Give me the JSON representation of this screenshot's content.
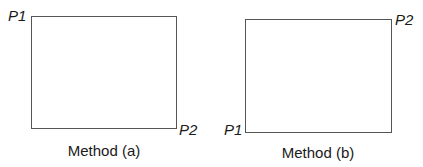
{
  "panels": [
    {
      "caption": "Method (a)",
      "rect": {
        "left": 31,
        "top": 16,
        "width": 146,
        "height": 113
      },
      "points": [
        {
          "label": "P1",
          "position": "top-left"
        },
        {
          "label": "P2",
          "position": "bottom-right"
        }
      ]
    },
    {
      "caption": "Method (b)",
      "rect": {
        "left": 245,
        "top": 19,
        "width": 147,
        "height": 114
      },
      "points": [
        {
          "label": "P1",
          "position": "bottom-left"
        },
        {
          "label": "P2",
          "position": "top-right"
        }
      ]
    }
  ],
  "colors": {
    "stroke": "#555555",
    "text": "#1a1a1a",
    "background": "#ffffff"
  }
}
